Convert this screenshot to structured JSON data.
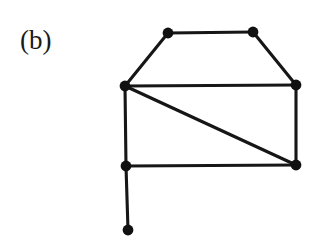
{
  "figure": {
    "panel_label": "(b)",
    "background_color": "#ffffff",
    "ink_color": "#161616",
    "width": 318,
    "height": 239
  },
  "chart_data": {
    "type": "diagram",
    "diagram_kind": "undirected-graph",
    "title": "(b)",
    "vertex_count": 7,
    "edge_count": 9,
    "vertex_radius": 5.4,
    "edge_stroke_width": 3.1,
    "nodes": [
      {
        "id": "v1",
        "name": "top-left",
        "x": 168,
        "y": 33
      },
      {
        "id": "v2",
        "name": "top-right",
        "x": 253,
        "y": 32
      },
      {
        "id": "v3",
        "name": "left-middle",
        "x": 125,
        "y": 86
      },
      {
        "id": "v4",
        "name": "right-middle",
        "x": 296,
        "y": 85
      },
      {
        "id": "v5",
        "name": "bottom-left",
        "x": 126,
        "y": 166
      },
      {
        "id": "v6",
        "name": "bottom-right",
        "x": 296,
        "y": 165
      },
      {
        "id": "v7",
        "name": "pendant-bottom",
        "x": 128,
        "y": 230
      }
    ],
    "edges": [
      {
        "id": "e1",
        "name": "top-edge",
        "from": "v1",
        "to": "v2",
        "x1": 168,
        "y1": 33,
        "x2": 253,
        "y2": 32
      },
      {
        "id": "e2",
        "name": "upper-left-slope",
        "from": "v1",
        "to": "v3",
        "x1": 168,
        "y1": 33,
        "x2": 125,
        "y2": 86
      },
      {
        "id": "e3",
        "name": "upper-right-slope",
        "from": "v2",
        "to": "v4",
        "x1": 253,
        "y1": 32,
        "x2": 296,
        "y2": 85
      },
      {
        "id": "e4",
        "name": "middle-horizontal",
        "from": "v3",
        "to": "v4",
        "x1": 125,
        "y1": 86,
        "x2": 296,
        "y2": 85
      },
      {
        "id": "e5",
        "name": "left-vertical",
        "from": "v3",
        "to": "v5",
        "x1": 125,
        "y1": 86,
        "x2": 126,
        "y2": 166
      },
      {
        "id": "e6",
        "name": "diagonal",
        "from": "v3",
        "to": "v6",
        "x1": 125,
        "y1": 86,
        "x2": 296,
        "y2": 165
      },
      {
        "id": "e7",
        "name": "right-vertical",
        "from": "v4",
        "to": "v6",
        "x1": 296,
        "y1": 85,
        "x2": 296,
        "y2": 165
      },
      {
        "id": "e8",
        "name": "bottom-horizontal",
        "from": "v5",
        "to": "v6",
        "x1": 126,
        "y1": 166,
        "x2": 296,
        "y2": 165
      },
      {
        "id": "e9",
        "name": "pendant-edge",
        "from": "v5",
        "to": "v7",
        "x1": 126,
        "y1": 166,
        "x2": 128,
        "y2": 230
      }
    ],
    "adjacency": {
      "v1": [
        "v2",
        "v3"
      ],
      "v2": [
        "v1",
        "v4"
      ],
      "v3": [
        "v1",
        "v4",
        "v5",
        "v6"
      ],
      "v4": [
        "v2",
        "v3",
        "v6"
      ],
      "v5": [
        "v3",
        "v6",
        "v7"
      ],
      "v6": [
        "v3",
        "v4",
        "v5"
      ],
      "v7": [
        "v5"
      ]
    },
    "degrees": {
      "v1": 2,
      "v2": 2,
      "v3": 4,
      "v4": 3,
      "v5": 3,
      "v6": 3,
      "v7": 1
    }
  }
}
